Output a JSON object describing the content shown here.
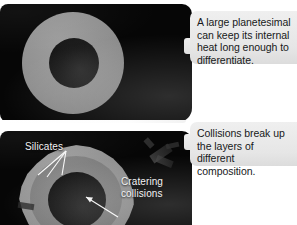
{
  "figure": {
    "background_color": "#ffffff"
  },
  "panels": [
    {
      "id": "panel-top",
      "name": "differentiated-planetesimal-panel",
      "background_color": "#060606",
      "body": {
        "name": "planetesimal-differentiated",
        "layers": [
          {
            "name": "mantle",
            "label": "silicate mantle",
            "color": "#8e8e8e",
            "shape": "circle"
          },
          {
            "name": "core",
            "label": "metal core",
            "color": "#1d1d1d",
            "shape": "circle"
          }
        ]
      },
      "labels": []
    },
    {
      "id": "panel-bottom",
      "name": "collisional-breakup-panel",
      "background_color": "#060606",
      "body": {
        "name": "planetesimal-fragmented",
        "layers": [
          {
            "name": "crust",
            "label": "outer silicate crust",
            "color": "#919191",
            "shape": "irregular"
          },
          {
            "name": "mantle",
            "label": "inner silicate mantle",
            "color": "#7c7c7c",
            "shape": "circle"
          },
          {
            "name": "core",
            "label": "metal core",
            "color": "#1b1b1b",
            "shape": "circle"
          }
        ]
      },
      "labels": [
        {
          "name": "label-silicates",
          "text": "Silicates",
          "color": "#f2f2f2",
          "leader_lines": 3
        },
        {
          "name": "label-cratering",
          "text": "Cratering\ncollisions",
          "color": "#f2f2f2",
          "leader_lines": 1
        }
      ],
      "debris": {
        "name": "impact-debris-fragments",
        "count": 5,
        "color": "#3d3d3d"
      }
    }
  ],
  "callouts": [
    {
      "id": "callout-1",
      "name": "callout-differentiation",
      "text": "A large planetesimal\ncan keep its internal\nheat long enough to\ndifferentiate.",
      "background_color": "#e9e9e9",
      "text_color": "#17191a"
    },
    {
      "id": "callout-2",
      "name": "callout-collisions",
      "text": "Collisions break up\nthe layers of different\ncomposition.",
      "background_color": "#e9e9e9",
      "text_color": "#17191a"
    }
  ],
  "annotations": {
    "silicates_label": "Silicates",
    "cratering_label": "Cratering\ncollisions"
  }
}
